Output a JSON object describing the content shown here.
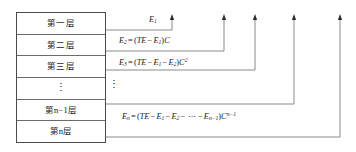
{
  "diagram": {
    "stack": {
      "name": "layer-stack",
      "rows": [
        {
          "id": "layer-1",
          "label": "第一层"
        },
        {
          "id": "layer-2",
          "label": "第二层"
        },
        {
          "id": "layer-3",
          "label": "第三层"
        },
        {
          "id": "layer-ellipsis",
          "label": "⋮"
        },
        {
          "id": "layer-n-minus-1",
          "label": "第n−1层"
        },
        {
          "id": "layer-n",
          "label": "第n层"
        }
      ]
    },
    "outside_ellipsis": "⋮",
    "formulas": [
      {
        "id": "formula-e1",
        "source_row": "layer-1",
        "plain": "E₁",
        "parts": [
          {
            "t": "E",
            "style": "italic"
          },
          {
            "t": "1",
            "style": "sub"
          }
        ]
      },
      {
        "id": "formula-e2",
        "source_row": "layer-2",
        "plain": "E₂ = (TE − E₁)C",
        "parts": [
          {
            "t": "E",
            "style": "italic"
          },
          {
            "t": "2",
            "style": "sub"
          },
          {
            "t": "=",
            "style": "normal"
          },
          {
            "t": "(",
            "style": "normal"
          },
          {
            "t": "TE",
            "style": "italic"
          },
          {
            "t": "−",
            "style": "normal"
          },
          {
            "t": "E",
            "style": "italic"
          },
          {
            "t": "1",
            "style": "sub"
          },
          {
            "t": ")",
            "style": "normal"
          },
          {
            "t": "C",
            "style": "italic"
          }
        ]
      },
      {
        "id": "formula-e3",
        "source_row": "layer-3",
        "plain": "E₃ = (TE − E₁ − E₂)C²",
        "parts": [
          {
            "t": "E",
            "style": "italic"
          },
          {
            "t": "3",
            "style": "sub"
          },
          {
            "t": "=",
            "style": "normal"
          },
          {
            "t": "(",
            "style": "normal"
          },
          {
            "t": "TE",
            "style": "italic"
          },
          {
            "t": "−",
            "style": "normal"
          },
          {
            "t": "E",
            "style": "italic"
          },
          {
            "t": "1",
            "style": "sub"
          },
          {
            "t": "−",
            "style": "normal"
          },
          {
            "t": "E",
            "style": "italic"
          },
          {
            "t": "2",
            "style": "sub"
          },
          {
            "t": ")",
            "style": "normal"
          },
          {
            "t": "C",
            "style": "italic"
          },
          {
            "t": "2",
            "style": "sup"
          }
        ]
      },
      {
        "id": "formula-en",
        "source_row": "layer-n",
        "plain": "Eₙ = (TE − E₁ − E₂ − ⋯ − Eₙ₋₁)Cⁿ⁻¹",
        "parts": [
          {
            "t": "E",
            "style": "italic"
          },
          {
            "t": "n",
            "style": "sub"
          },
          {
            "t": "=",
            "style": "normal"
          },
          {
            "t": "(",
            "style": "normal"
          },
          {
            "t": "TE",
            "style": "italic"
          },
          {
            "t": "−",
            "style": "normal"
          },
          {
            "t": "E",
            "style": "italic"
          },
          {
            "t": "1",
            "style": "sub"
          },
          {
            "t": "−",
            "style": "normal"
          },
          {
            "t": "E",
            "style": "italic"
          },
          {
            "t": "2",
            "style": "sub"
          },
          {
            "t": "−",
            "style": "normal"
          },
          {
            "t": "⋯",
            "style": "normal"
          },
          {
            "t": "−",
            "style": "normal"
          },
          {
            "t": "E",
            "style": "italic"
          },
          {
            "t": "n−1",
            "style": "sub"
          },
          {
            "t": ")",
            "style": "normal"
          },
          {
            "t": "C",
            "style": "italic"
          },
          {
            "t": "n−1",
            "style": "sup"
          }
        ]
      }
    ],
    "connectors": [
      {
        "id": "connector-1",
        "from_row": "layer-1",
        "y": 30,
        "arrow_x": 172
      },
      {
        "id": "connector-2",
        "from_row": "layer-2",
        "y": 51,
        "arrow_x": 224
      },
      {
        "id": "connector-3",
        "from_row": "layer-3",
        "y": 70,
        "arrow_x": 255
      },
      {
        "id": "connector-4",
        "from_row": "layer-n-minus-1",
        "y": 104,
        "arrow_x": 294
      },
      {
        "id": "connector-5",
        "from_row": "layer-n",
        "y": 137,
        "arrow_x": 340
      }
    ],
    "colors": {
      "box_border": "#4a4a4a",
      "row_divider": "#6b6b6b",
      "connector_line": "#8a8a8a",
      "arrowhead": "#2b2b2b",
      "text": "#1a1a1a",
      "background": "#ffffff"
    },
    "geometry": {
      "box_left": 16,
      "box_top": 12,
      "box_width": 90,
      "box_height": 131,
      "arrow_top_y": 14
    }
  }
}
